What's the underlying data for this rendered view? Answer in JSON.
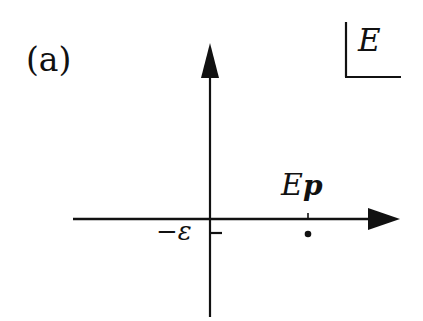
{
  "figure": {
    "panel_label": "(a)",
    "unit_box_label": "E",
    "axes": {
      "horizontal": {
        "direction": "right",
        "arrow": true
      },
      "vertical": {
        "direction": "up",
        "arrow": true
      }
    },
    "tick_minus_epsilon": {
      "prefix": "−",
      "symbol": "ε"
    },
    "point_label": {
      "E": "E",
      "subscript": "p"
    },
    "colors": {
      "ink": "#111111",
      "background": "#ffffff"
    }
  }
}
